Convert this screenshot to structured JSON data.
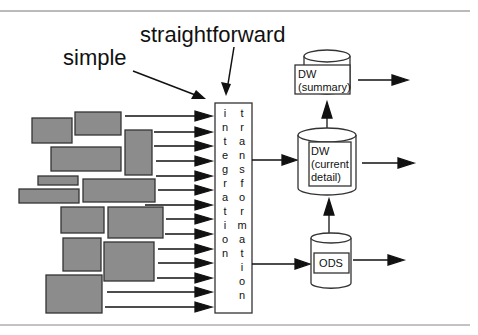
{
  "labels": {
    "simple": "simple",
    "straightforward": "straightforward"
  },
  "integration_box": {
    "left_column": [
      "i",
      "n",
      "t",
      "e",
      "g",
      "r",
      "a",
      "t",
      "i",
      "o",
      "n"
    ],
    "right_column": [
      "t",
      "r",
      "a",
      "n",
      "s",
      "f",
      "o",
      "r",
      "m",
      "a",
      "t",
      "i",
      "o",
      "n"
    ]
  },
  "stores": {
    "dw_summary": {
      "line1": "DW",
      "line2": "(summary)"
    },
    "dw_current": {
      "line1": "DW",
      "line2": "(current",
      "line3": "detail)"
    },
    "ods": {
      "line1": "ODS"
    }
  },
  "colors": {
    "source_fill": "#8c8c8c",
    "line": "#222222",
    "rule": "#777777"
  }
}
